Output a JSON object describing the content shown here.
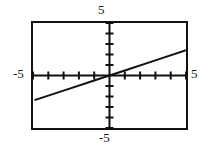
{
  "widget": {
    "name": "graphing-calculator-plot",
    "kind": "coordinate-grid-line-graph",
    "background_color": "#ffffff",
    "ink_color": "#111111"
  },
  "labels": {
    "top": "5",
    "left": "-5",
    "right": "5",
    "bottom": "-5"
  },
  "chart_data": {
    "type": "line",
    "title": "",
    "xlabel": "",
    "ylabel": "",
    "xlim": [
      -5,
      5
    ],
    "ylim": [
      -5,
      5
    ],
    "grid": false,
    "legend": null,
    "axes": {
      "x_axis_y_value": 0,
      "y_axis_x_value": 0,
      "x_ticks": [
        -5,
        -4,
        -3,
        -2,
        -1,
        1,
        2,
        3,
        4,
        5
      ],
      "y_ticks": [
        -5,
        -4,
        -3,
        -2,
        -1,
        1,
        2,
        3,
        4,
        5
      ],
      "tick_step": 1,
      "tick_length_px": 4
    },
    "series": [
      {
        "name": "line",
        "equation": "y = 0.48x",
        "slope": 0.48,
        "intercept": 0,
        "x": [
          -4.9,
          -3,
          -1,
          0,
          1,
          3,
          5
        ],
        "values": [
          -2.35,
          -1.44,
          -0.48,
          0,
          0.48,
          1.44,
          2.4
        ],
        "color": "#111111",
        "width_px": 2
      }
    ]
  }
}
